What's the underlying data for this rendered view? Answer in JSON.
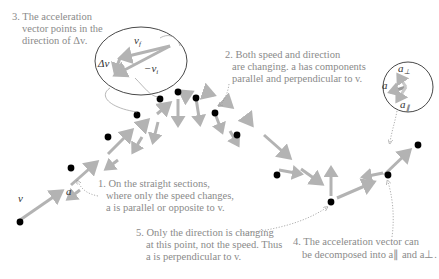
{
  "colors": {
    "arrow": "#b3b3b3",
    "dot": "#000000",
    "text": "#8a8a8a",
    "ellipse": "#333333",
    "vector_label": "#333333"
  },
  "labels": {
    "v": "v",
    "a": "a",
    "vf": "v",
    "vf_sub": "f",
    "neg_vi": "−v",
    "neg_vi_sub": "i",
    "delta_v": "Δv",
    "a_perp": "a",
    "a_perp_sub": "⊥",
    "a_par": "a",
    "a_par_sub": "∥",
    "a_inset": "a"
  },
  "annotations": {
    "note1": {
      "lines": [
        "1. On the straight sections,",
        "where only the speed changes,",
        "a is parallel or opposite to v."
      ]
    },
    "note2": {
      "lines": [
        "2. Both speed and direction",
        "are changing. a has components",
        "parallel and perpendicular to v."
      ]
    },
    "note3": {
      "lines": [
        "3. The acceleration",
        "vector points in the",
        "direction of Δv."
      ]
    },
    "note4": {
      "lines": [
        "4. The acceleration vector can",
        "be decomposed into a∥ and a⊥."
      ]
    },
    "note5": {
      "lines": [
        "5. Only the direction is changing",
        "at this point, not the speed. Thus",
        "a is perpendicular to v."
      ]
    }
  }
}
